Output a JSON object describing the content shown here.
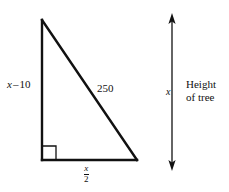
{
  "figure": {
    "type": "geometry-diagram",
    "background_color": "#ffffff",
    "stroke_color": "#111111",
    "width": 229,
    "height": 192,
    "triangle": {
      "name": "right-triangle",
      "vertices": {
        "apex": [
          42,
          20
        ],
        "bottom_left": [
          42,
          160
        ],
        "bottom_right": [
          137,
          160
        ]
      },
      "right_angle_at": "bottom_left"
    },
    "labels": {
      "left_leg": {
        "variable": "x",
        "operator": "–",
        "number": "10",
        "full_text": "x – 10"
      },
      "hypotenuse": "250",
      "base": {
        "numerator": "x",
        "denominator": "2",
        "full_text": "x/2"
      },
      "arrow_measure": "x"
    },
    "caption": {
      "line1": "Height",
      "line2": "of tree"
    },
    "arrow": {
      "name": "height-of-tree-arrow",
      "orientation": "vertical",
      "double_headed": true,
      "x": 172,
      "top_y": 14,
      "bottom_y": 170
    }
  }
}
